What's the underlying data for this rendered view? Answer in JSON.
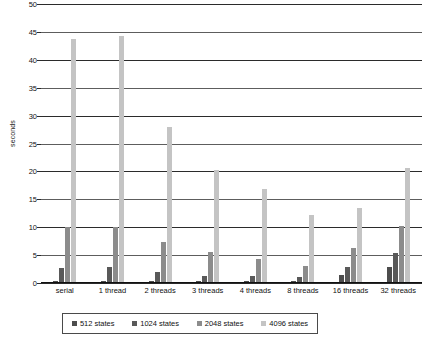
{
  "chart_data": {
    "type": "bar",
    "title": "",
    "xlabel": "",
    "ylabel": "seconds",
    "ylim": [
      0,
      50
    ],
    "ytick_step": 5,
    "yticks": [
      0,
      5,
      10,
      15,
      20,
      25,
      30,
      35,
      40,
      45,
      50
    ],
    "grid": true,
    "legend_position": "bottom",
    "categories": [
      "serial",
      "1 thread",
      "2 threads",
      "3 threads",
      "4 threads",
      "8 threads",
      "16 threads",
      "32 threads"
    ],
    "series": [
      {
        "name": "512 states",
        "color": "#4d4d4d",
        "values": [
          0.3,
          0.3,
          0.3,
          0.3,
          0.3,
          0.4,
          1.4,
          2.8
        ]
      },
      {
        "name": "1024 states",
        "color": "#595959",
        "values": [
          2.7,
          2.8,
          1.9,
          1.3,
          1.2,
          1.0,
          2.8,
          5.4
        ]
      },
      {
        "name": "2048 states",
        "color": "#8c8c8c",
        "values": [
          10.1,
          10.1,
          7.3,
          5.6,
          4.3,
          3.1,
          6.2,
          10.2
        ]
      },
      {
        "name": "4096 states",
        "color": "#c4c4c4",
        "values": [
          43.7,
          44.3,
          28.0,
          20.2,
          16.8,
          12.1,
          13.5,
          20.7
        ]
      }
    ]
  },
  "legend": {
    "items": [
      {
        "label": "512 states"
      },
      {
        "label": "1024 states"
      },
      {
        "label": "2048 states"
      },
      {
        "label": "4096 states"
      }
    ]
  },
  "axis": {
    "y_title": "seconds"
  }
}
